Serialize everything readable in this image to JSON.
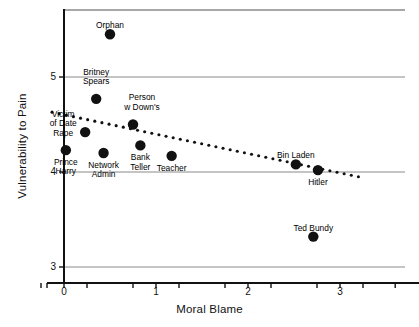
{
  "chart_data": {
    "type": "scatter",
    "title": "",
    "xlabel": "Moral Blame",
    "ylabel": "Vulnerability to Pain",
    "xlim": [
      -0.35,
      3.75
    ],
    "ylim": [
      2.78,
      5.68
    ],
    "xticks": [
      0,
      1,
      2,
      3
    ],
    "xtick_labels": [
      "0",
      "1",
      "2",
      "3"
    ],
    "yticks": [
      3,
      4,
      5
    ],
    "ytick_labels": [
      "3",
      "4",
      "5"
    ],
    "xminor_ticks": [
      -0.25,
      0.25,
      0.75,
      1.25,
      1.75,
      2.25,
      2.75,
      3.25,
      3.6
    ],
    "grid": "horizontal",
    "legend": "none",
    "points": [
      {
        "label": "Orphan",
        "x": 0.5,
        "y": 5.45,
        "label_dx": 0,
        "label_dy": -13,
        "label_align": "above"
      },
      {
        "label": "Britney\nSpears",
        "x": 0.35,
        "y": 4.77,
        "label_dx": 0,
        "label_dy": -22,
        "label_align": "above"
      },
      {
        "label": "Victim\nof Date\nRape",
        "x": 0.23,
        "y": 4.42,
        "label_dx": -22,
        "label_dy": -22,
        "label_align": "left"
      },
      {
        "label": "Person\nw Down's",
        "x": 0.75,
        "y": 4.5,
        "label_dx": 9,
        "label_dy": -22,
        "label_align": "above"
      },
      {
        "label": "Prince\nHarry",
        "x": 0.02,
        "y": 4.23,
        "label_dx": 0,
        "label_dy": 8,
        "label_align": "below"
      },
      {
        "label": "Network\nAdmin",
        "x": 0.43,
        "y": 4.2,
        "label_dx": 0,
        "label_dy": 8,
        "label_align": "below"
      },
      {
        "label": "Bank\nTeller",
        "x": 0.83,
        "y": 4.28,
        "label_dx": 0,
        "label_dy": 8,
        "label_align": "below"
      },
      {
        "label": "Teacher",
        "x": 1.17,
        "y": 4.17,
        "label_dx": 0,
        "label_dy": 8,
        "label_align": "below"
      },
      {
        "label": "Bin Laden",
        "x": 2.52,
        "y": 4.08,
        "label_dx": 0,
        "label_dy": -13,
        "label_align": "above"
      },
      {
        "label": "Hitler",
        "x": 2.76,
        "y": 4.02,
        "label_dx": 0,
        "label_dy": 8,
        "label_align": "below"
      },
      {
        "label": "Ted Bundy",
        "x": 2.71,
        "y": 3.32,
        "label_dx": 0,
        "label_dy": -13,
        "label_align": "above"
      }
    ],
    "trendline": {
      "style": "dotted",
      "x_start": -0.13,
      "y_start": 4.63,
      "x_end": 3.2,
      "y_end": 3.95
    },
    "colors": {
      "point": "#111111",
      "gridline": "#8a8a8a",
      "axis": "#111111",
      "trendline": "#111111",
      "background": "#ffffff"
    }
  }
}
